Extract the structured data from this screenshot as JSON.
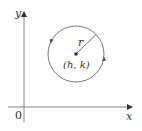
{
  "diagram": {
    "type": "circle-in-coordinate-plane",
    "axes": {
      "x_label": "x",
      "y_label": "y",
      "origin_label": "0"
    },
    "circle": {
      "center_label": "(h, k)",
      "radius_label": "r",
      "orientation": "counterclockwise"
    },
    "colors": {
      "stroke": "#555555",
      "text": "#333333",
      "background": "#ffffff"
    }
  }
}
